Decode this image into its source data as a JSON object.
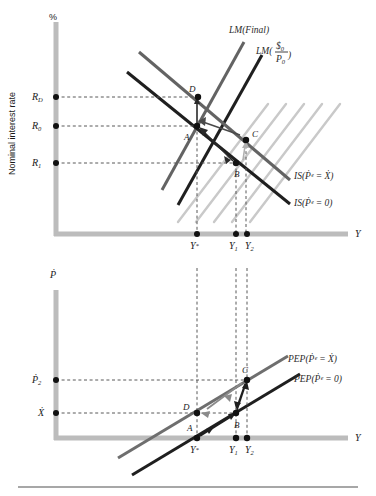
{
  "figure": {
    "background": "#ffffff",
    "axis_color": "#b8b8b8",
    "dark_line": "#1a1a1a",
    "gray_line": "#7d7d7d",
    "light_line": "#c8c8c8",
    "dash_color": "#555555",
    "bottom_rule_color": "#8a8a8a"
  },
  "top_panel": {
    "y_axis_title": "Nominal interest rate",
    "y_axis_unit": "%",
    "x_axis_title": "Y",
    "y_ticks": [
      {
        "id": "R_D",
        "base": "R",
        "sub": "D",
        "y": 97
      },
      {
        "id": "R_0",
        "base": "R",
        "sub": "0",
        "y": 126
      },
      {
        "id": "R_1",
        "base": "R",
        "sub": "1",
        "y": 163
      }
    ],
    "x_ticks": [
      {
        "id": "Y_star",
        "base": "Y",
        "sub": "*",
        "x": 197
      },
      {
        "id": "Y_1",
        "base": "Y",
        "sub": "1",
        "x": 236
      },
      {
        "id": "Y_2",
        "base": "Y",
        "sub": "2",
        "x": 247
      }
    ],
    "curve_labels": [
      {
        "id": "lm-final",
        "text": "LM(Final)",
        "x": 231,
        "y": 33
      },
      {
        "id": "lm-real-balances",
        "text": "LM(",
        "x": 258,
        "y": 51,
        "num": "$",
        "num_sub": "0",
        "den": "P",
        "den_sub": "0",
        "close": ")"
      },
      {
        "id": "is-pe-xdot",
        "text": "IS(Ṗᵉ = Ẋ)",
        "x": 294,
        "y": 176
      },
      {
        "id": "is-pe-zero",
        "text": "IS(Ṗᵉ = 0)",
        "x": 294,
        "y": 203
      }
    ],
    "points": [
      {
        "label": "D",
        "x": 198,
        "y": 97,
        "lx": 189,
        "ly": 92
      },
      {
        "label": "A",
        "x": 197,
        "y": 126,
        "lx": 186,
        "ly": 139
      },
      {
        "label": "C",
        "x": 246,
        "y": 140,
        "lx": 252,
        "ly": 137
      },
      {
        "label": "B",
        "x": 236,
        "y": 163,
        "lx": 235,
        "ly": 176
      }
    ]
  },
  "bottom_panel": {
    "y_axis_title": "Ṗ",
    "x_axis_title": "Y",
    "y_ticks": [
      {
        "id": "Pdot_2",
        "base": "Ṗ",
        "sub": "2",
        "y": 380
      },
      {
        "id": "Xdot",
        "base": "Ẋ",
        "sub": "",
        "y": 413
      }
    ],
    "x_ticks": [
      {
        "id": "Y_star",
        "base": "Y",
        "sub": "*",
        "x": 197
      },
      {
        "id": "Y_1",
        "base": "Y",
        "sub": "1",
        "x": 236
      },
      {
        "id": "Y_2",
        "base": "Y",
        "sub": "2",
        "x": 247
      }
    ],
    "curve_labels": [
      {
        "id": "pep-pe-xdot",
        "text": "PEP(Ṗᵉ = Ẋ)",
        "x": 288,
        "y": 360
      },
      {
        "id": "pep-pe-zero",
        "text": "PEP(Ṗᵉ = 0)",
        "x": 296,
        "y": 379
      }
    ],
    "points": [
      {
        "label": "D",
        "x": 197,
        "y": 413,
        "lx": 184,
        "ly": 409
      },
      {
        "label": "A",
        "x": 197,
        "y": 438,
        "lx": 188,
        "ly": 430
      },
      {
        "label": "B",
        "x": 236,
        "y": 413,
        "lx": 236,
        "ly": 427
      },
      {
        "label": "C",
        "x": 247,
        "y": 380,
        "lx": 243,
        "ly": 372
      }
    ]
  }
}
